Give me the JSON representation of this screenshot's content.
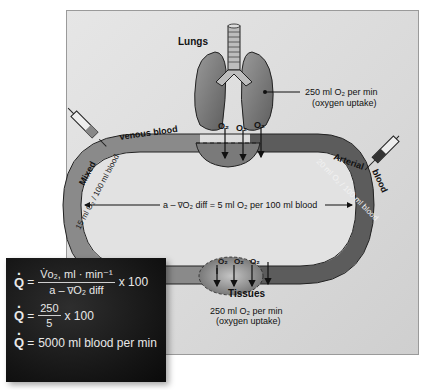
{
  "diagram": {
    "lungs": {
      "label": "Lungs",
      "uptake_line1": "250 ml O₂ per min",
      "uptake_line2": "(oxygen uptake)",
      "o2_labels": [
        "O₂",
        "O₂",
        "O₂"
      ]
    },
    "venous": {
      "label_word1": "Mixed",
      "label_word2": "venous blood",
      "content": "15 ml O₂ / 100 ml blood"
    },
    "arterial": {
      "label_word1": "Arterial",
      "label_word2": "blood",
      "content": "20 ml O₂ / 100 ml blood"
    },
    "avdiff": {
      "label": "a – v̅O₂ diff = 5 ml O₂ per 100 ml blood"
    },
    "tissues": {
      "label": "Tissues",
      "uptake_line1": "250 ml O₂ per min",
      "uptake_line2": "(oxygen uptake)",
      "o2_labels": [
        "O₂",
        "O₂",
        "O₂"
      ]
    },
    "colors": {
      "panel": "#dcdcdc",
      "vessel_venous": "#8a8a8a",
      "vessel_arterial": "#5a5a5a",
      "lung_fill": "#7a7a7a",
      "equation_bg": "#141414"
    }
  },
  "equations": {
    "eq1": {
      "lhs": "Q",
      "equals": "=",
      "numerator": "V̇o₂, ml · min⁻¹",
      "denominator": "a – v̅O₂ diff",
      "multiplier": "x 100"
    },
    "eq2": {
      "lhs": "Q",
      "equals": "=",
      "numerator": "250",
      "denominator": "5",
      "multiplier": "x 100"
    },
    "eq3": {
      "lhs": "Q",
      "equals": "=",
      "result": "5000 ml blood per min"
    }
  }
}
